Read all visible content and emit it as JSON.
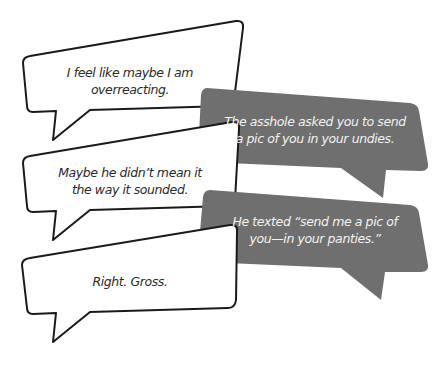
{
  "colors": {
    "background": "#ffffff",
    "white_bubble_fill": "#ffffff",
    "white_bubble_stroke": "#1a1a1a",
    "gray_bubble_fill": "#6f6f6f",
    "dark_text": "#2a2a2a",
    "light_text": "#f2f2f2"
  },
  "conversation": {
    "bubbles": [
      {
        "side": "left",
        "style": "white",
        "line1": "I feel like maybe I am",
        "line2": "overreacting."
      },
      {
        "side": "right",
        "style": "gray",
        "line1": "The asshole asked you to send",
        "line2": "a pic of you in your undies."
      },
      {
        "side": "left",
        "style": "white",
        "line1": "Maybe he didn’t mean it",
        "line2": "the way it sounded."
      },
      {
        "side": "right",
        "style": "gray",
        "line1": "He texted “send me a pic of",
        "line2": "you—in your panties.”"
      },
      {
        "side": "left",
        "style": "white",
        "line1": "Right. Gross.",
        "line2": ""
      }
    ]
  }
}
